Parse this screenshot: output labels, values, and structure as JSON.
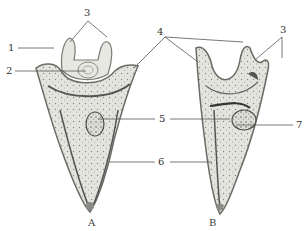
{
  "figure": {
    "panels": [
      {
        "id": "A",
        "caption": "A"
      },
      {
        "id": "B",
        "caption": "B"
      }
    ],
    "labels": {
      "l1": "1",
      "l2": "2",
      "l3a": "3",
      "l3b": "3",
      "l4": "4",
      "l5": "5",
      "l6": "6",
      "l7": "7"
    },
    "colors": {
      "line": "#555555",
      "cell_fill": "#d9d9d4",
      "cell_stroke": "#6b6b66",
      "nucleus": "#5a5a55"
    }
  }
}
